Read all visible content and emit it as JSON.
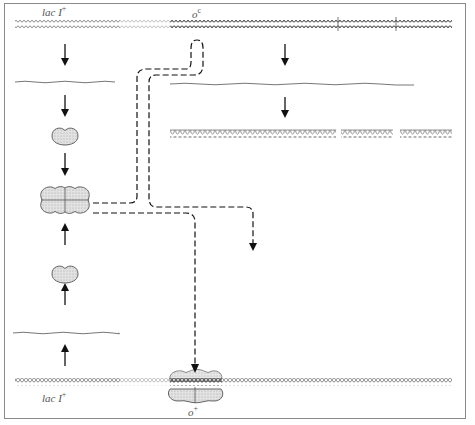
{
  "diagram": {
    "labels": {
      "top_gene": "lac I",
      "top_gene_sup": "+",
      "top_operator": "o",
      "top_operator_sup": "c",
      "bottom_gene": "lac I",
      "bottom_gene_sup": "+",
      "bottom_operator": "o",
      "bottom_operator_sup": "+"
    },
    "elements": {
      "top_dna": "upper chromosome with o^c operator (repressor cannot bind)",
      "bottom_dna": "lower chromosome with o+ operator bound by repressor",
      "left_mrna_top": "lacI mRNA (from upper copy)",
      "left_mrna_bottom": "lacI mRNA (from lower copy)",
      "repressor_monomer_top": "repressor monomer",
      "repressor_monomer_bottom": "repressor monomer",
      "repressor_tetramer": "active repressor tetramer",
      "right_mrna": "lac operon polycistronic mRNA",
      "proteins": [
        "β-galactosidase",
        "permease",
        "transacetylase"
      ]
    },
    "colors": {
      "dna": "#8c8c8c",
      "arrow": "#111111",
      "protein_fill": "#d6d6d6",
      "protein_stroke": "#555555",
      "frame": "#8a8a8a"
    }
  }
}
